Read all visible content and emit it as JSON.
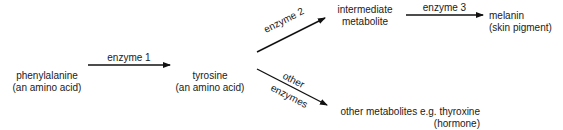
{
  "nodes": {
    "phenylalanine": {
      "name": "phenylalanine",
      "note": "(an amino acid)"
    },
    "tyrosine": {
      "name": "tyrosine",
      "note": "(an amino acid)"
    },
    "intermediate": {
      "line1": "intermediate",
      "line2": "metabolite"
    },
    "melanin": {
      "name": "melanin",
      "note": "(skin pigment)"
    },
    "other_metabolites": {
      "name": "other metabolites e.g. thyroxine",
      "note": "(hormone)"
    }
  },
  "edges": {
    "enzyme1": "enzyme 1",
    "enzyme2": "enzyme 2",
    "enzyme3": "enzyme 3",
    "other_line1": "other",
    "other_line2": "enzymes"
  }
}
